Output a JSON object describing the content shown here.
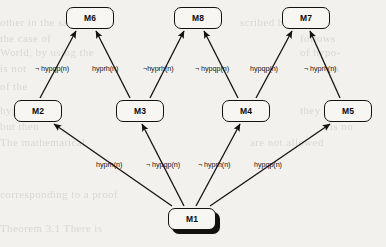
{
  "diagram": {
    "type": "hypothesis-derivation-graph",
    "title": "",
    "background_color": "#f2f1ee",
    "node_fill_color": "#f7f6f3",
    "stroke_color": "#15130f",
    "nodes": [
      {
        "id": "M1",
        "label": "M1",
        "x": 168,
        "y": 208,
        "w": 48,
        "h": 22,
        "shadow": true,
        "role": "root"
      },
      {
        "id": "M2",
        "label": "M2",
        "x": 14,
        "y": 100,
        "w": 48,
        "h": 22,
        "shadow": false,
        "role": "intermediate"
      },
      {
        "id": "M3",
        "label": "M3",
        "x": 116,
        "y": 100,
        "w": 48,
        "h": 22,
        "shadow": false,
        "role": "intermediate"
      },
      {
        "id": "M4",
        "label": "M4",
        "x": 222,
        "y": 100,
        "w": 48,
        "h": 22,
        "shadow": false,
        "role": "intermediate"
      },
      {
        "id": "M5",
        "label": "M5",
        "x": 324,
        "y": 100,
        "w": 48,
        "h": 22,
        "shadow": false,
        "role": "intermediate"
      },
      {
        "id": "M6",
        "label": "M6",
        "x": 66,
        "y": 7,
        "w": 48,
        "h": 22,
        "shadow": false,
        "role": "leaf"
      },
      {
        "id": "M8",
        "label": "M8",
        "x": 174,
        "y": 7,
        "w": 48,
        "h": 22,
        "shadow": false,
        "role": "leaf"
      },
      {
        "id": "M7",
        "label": "M7",
        "x": 282,
        "y": 7,
        "w": 48,
        "h": 22,
        "shadow": false,
        "role": "leaf"
      }
    ],
    "edges": [
      {
        "id": "e1",
        "from": "M1",
        "to": "M2",
        "label": "hyprh(n)",
        "x1": 172,
        "y1": 206,
        "x2": 54,
        "y2": 124,
        "lx": 96,
        "ly": 160
      },
      {
        "id": "e2",
        "from": "M1",
        "to": "M3",
        "label": "¬ hypqp(n)",
        "x1": 184,
        "y1": 206,
        "x2": 142,
        "y2": 124,
        "lx": 146,
        "ly": 160
      },
      {
        "id": "e3",
        "from": "M1",
        "to": "M4",
        "label": "¬ hyprh(n)",
        "x1": 196,
        "y1": 206,
        "x2": 240,
        "y2": 124,
        "lx": 198,
        "ly": 160
      },
      {
        "id": "e4",
        "from": "M1",
        "to": "M5",
        "label": "hypqp(n)",
        "x1": 210,
        "y1": 206,
        "x2": 330,
        "y2": 124,
        "lx": 254,
        "ly": 160
      },
      {
        "id": "e5",
        "from": "M2",
        "to": "M6",
        "label": "¬ hypqp(n)",
        "x1": 40,
        "y1": 98,
        "x2": 76,
        "y2": 31,
        "lx": 35,
        "ly": 64
      },
      {
        "id": "e6",
        "from": "M3",
        "to": "M6",
        "label": "hyprh(n)",
        "x1": 130,
        "y1": 98,
        "x2": 96,
        "y2": 31,
        "lx": 92,
        "ly": 64
      },
      {
        "id": "e7",
        "from": "M3",
        "to": "M8",
        "label": "¬hyprh(n)",
        "x1": 150,
        "y1": 98,
        "x2": 184,
        "y2": 31,
        "lx": 143,
        "ly": 64
      },
      {
        "id": "e8",
        "from": "M4",
        "to": "M8",
        "label": "¬ hypqp(n)",
        "x1": 238,
        "y1": 98,
        "x2": 204,
        "y2": 31,
        "lx": 195,
        "ly": 64
      },
      {
        "id": "e9",
        "from": "M4",
        "to": "M7",
        "label": "hypqp(n)",
        "x1": 256,
        "y1": 98,
        "x2": 292,
        "y2": 31,
        "lx": 250,
        "ly": 64
      },
      {
        "id": "e10",
        "from": "M5",
        "to": "M7",
        "label": "¬ hyprh(n)",
        "x1": 340,
        "y1": 98,
        "x2": 310,
        "y2": 31,
        "lx": 304,
        "ly": 64
      }
    ],
    "background_text": [
      {
        "t": "other in the same",
        "x": 0,
        "y": 16,
        "s": 11
      },
      {
        "t": "scribed by the",
        "x": 240,
        "y": 16,
        "s": 11
      },
      {
        "t": "the case of",
        "x": 0,
        "y": 32,
        "s": 11
      },
      {
        "t": "follows",
        "x": 300,
        "y": 32,
        "s": 11
      },
      {
        "t": "World, by using the",
        "x": 0,
        "y": 46,
        "s": 11
      },
      {
        "t": "of hypo-",
        "x": 300,
        "y": 46,
        "s": 11
      },
      {
        "t": "is not",
        "x": 0,
        "y": 62,
        "s": 11
      },
      {
        "t": "in",
        "x": 330,
        "y": 62,
        "s": 11
      },
      {
        "t": "of the",
        "x": 0,
        "y": 80,
        "s": 11
      },
      {
        "t": "hypo",
        "x": 0,
        "y": 104,
        "s": 11
      },
      {
        "t": "they",
        "x": 300,
        "y": 104,
        "s": 11
      },
      {
        "t": "but then",
        "x": 0,
        "y": 120,
        "s": 11
      },
      {
        "t": "is no",
        "x": 330,
        "y": 120,
        "s": 11
      },
      {
        "t": "The mathematical",
        "x": 0,
        "y": 136,
        "s": 11
      },
      {
        "t": "are not allowed",
        "x": 250,
        "y": 136,
        "s": 11
      },
      {
        "t": "corresponding to a proof",
        "x": 0,
        "y": 188,
        "s": 11
      },
      {
        "t": "Theorem 3.1 There is",
        "x": 0,
        "y": 222,
        "s": 11
      }
    ]
  }
}
